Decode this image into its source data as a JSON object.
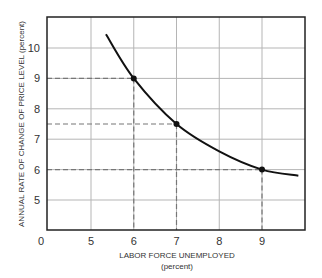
{
  "chart_data": {
    "type": "line",
    "title": "",
    "xlabel": "LABOR FORCE UNEMPLOYED",
    "xlabel_unit": "(percent)",
    "ylabel": "ANNUAL RATE OF CHANGE OF PRICE LEVEL (percent)",
    "x_origin_label": "0",
    "x_ticks": [
      5,
      6,
      7,
      8,
      9
    ],
    "y_ticks": [
      5,
      6,
      7,
      8,
      9,
      10
    ],
    "xlim": [
      4,
      10
    ],
    "ylim": [
      4,
      11
    ],
    "grid": true,
    "legend": null,
    "series": [
      {
        "name": "Phillips curve",
        "x": [
          5.35,
          6,
          7,
          8,
          9,
          9.85
        ],
        "y": [
          10.45,
          9,
          7.5,
          6.6,
          6,
          5.8
        ]
      }
    ],
    "highlighted_points": [
      {
        "x": 6,
        "y": 9
      },
      {
        "x": 7,
        "y": 7.5
      },
      {
        "x": 9,
        "y": 6
      }
    ]
  }
}
